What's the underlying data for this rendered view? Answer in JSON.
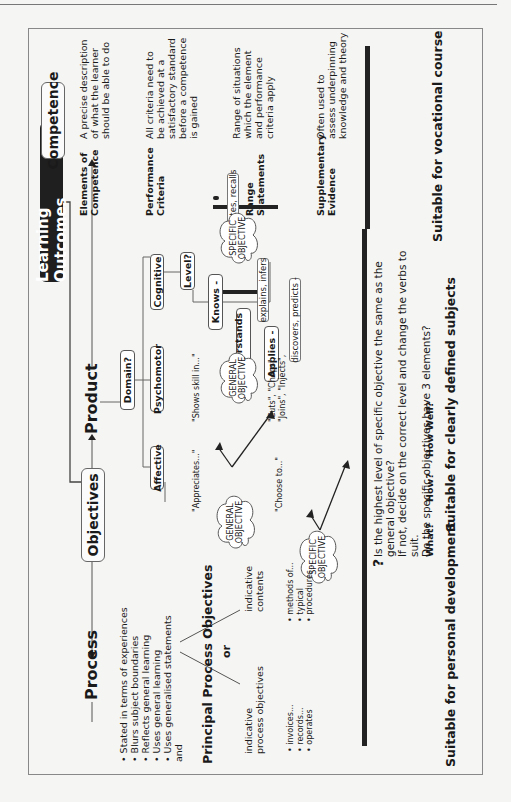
{
  "title": "Learning Outcomes",
  "branches": {
    "objectives": "Objectives",
    "product": "Product",
    "process": "Process",
    "competence": "Competence"
  },
  "process": {
    "bullets": [
      "Stated in terms of experiences",
      "Blurs subject boundaries",
      "Reflects general learning",
      "Uses general learning",
      "Uses generalised statements and"
    ],
    "principal_title": "Principal Process Objectives",
    "or_label": "or",
    "left": {
      "label_line1": "indicative",
      "label_line2": "process objectives",
      "items": [
        "invoices...",
        "records...",
        "operates"
      ]
    },
    "right": {
      "label_line1": "indicative",
      "label_line2": "contents",
      "items": [
        "methods of...",
        "typical",
        "procedures..."
      ]
    },
    "footer": "Suitable for personal development"
  },
  "product": {
    "domain_label": "Domain?",
    "domains": [
      "Affective",
      "Psychomotor",
      "Cognitive"
    ],
    "level_label": "Level?",
    "levels": [
      {
        "label": "Knows -",
        "verbs": "Lists, states, recalls"
      },
      {
        "label": "Understands -",
        "verbs": "explains, infers"
      },
      {
        "label": "Applies -",
        "verbs": "discovers, predicts -"
      }
    ],
    "quotes": {
      "appreciates": "\"Appreciates...\"",
      "shows_skill": "\"Shows skill in...\"",
      "choose_to": "\"Choose to...\"",
      "cuts_line1": "\"Cuts\", \"Chops\",",
      "cuts_line2": "\"Joins\", \"Injects\","
    },
    "clouds": {
      "general": [
        "GENERAL",
        "OBJECTIVE"
      ],
      "specific": [
        "SPECIFIC",
        "OBJECTIVE"
      ]
    },
    "question": {
      "mark": "?",
      "line1": "Is the highest level of specific objective the same as the",
      "line2": "general objective?",
      "line3": "If not, decide on the correct level and change the verbs to suit.",
      "line4": "Do the specific objectives have 3 elements?"
    },
    "elements": [
      "What?",
      "How?",
      "How Well?"
    ],
    "footer": "Suitable for clearly defined subjects"
  },
  "competence": {
    "rows": [
      {
        "term_line1": "Elements of",
        "term_line2": "Competence",
        "desc": [
          "A precise description",
          "of what the learner",
          "should be able to do"
        ]
      },
      {
        "term_line1": "Performance",
        "term_line2": "Criteria",
        "desc": [
          "All criteria need to",
          "be achieved at a",
          "satisfactory standard",
          "before a competence",
          "is gained"
        ]
      },
      {
        "term_line1": "Range",
        "term_line2": "Statements",
        "desc": [
          "Range of situations",
          "which the element",
          "and performance",
          "criteria apply"
        ]
      },
      {
        "term_line1": "Supplementary",
        "term_line2": "Evidence",
        "desc": [
          "Often used to",
          "assess underpinning",
          "knowledge and theory"
        ]
      }
    ],
    "footer": "Suitable for vocational course"
  }
}
